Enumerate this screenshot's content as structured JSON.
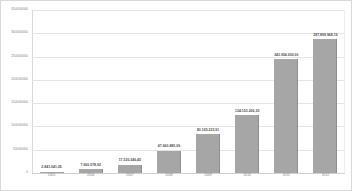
{
  "chart_data": {
    "type": "bar",
    "title": "",
    "subtitle": "",
    "xlabel": "",
    "ylabel": "",
    "categories": [
      "2005",
      "2006",
      "2007",
      "2008",
      "2009",
      "2010",
      "2011",
      "2012"
    ],
    "values": [
      2841041.05,
      7600578.92,
      17530346.45,
      47660885.09,
      83165223.91,
      124103206.3,
      243954000.0,
      287899968.16
    ],
    "value_labels": [
      "2.841.041,05",
      "7.600.578,92",
      "17.530.346,45",
      "47.660.885,09",
      "83.165.223,91",
      "124.103.206,30",
      "243.954.000,00",
      "287.899.968,16"
    ],
    "ylim": [
      0,
      350000000
    ],
    "ytick_values": [
      0,
      50000000,
      100000000,
      150000000,
      200000000,
      250000000,
      300000000,
      350000000
    ],
    "ytick_labels": [
      "0",
      "50000000",
      "100000000",
      "150000000",
      "200000000",
      "250000000",
      "300000000",
      "350000000"
    ],
    "grid": true,
    "legend": false,
    "legend_position": "none",
    "series": [
      {
        "name": "",
        "values": [
          2841041.05,
          7600578.92,
          17530346.45,
          47660885.09,
          83165223.91,
          124103206.3,
          243954000.0,
          287899968.16
        ]
      }
    ],
    "colors": {
      "bar_fill": "#a6a6a6",
      "bar_edge": "#8e8e8e",
      "gridline": "#e4e4e4",
      "axis_line": "#d9d9d9",
      "tick_text": "#808080",
      "value_text": "#4a4a4a",
      "background": "#ffffff",
      "border": "#d9d9d9"
    }
  }
}
